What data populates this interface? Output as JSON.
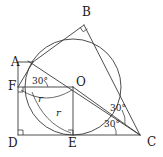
{
  "figure": {
    "kind": "geometry-diagram",
    "stroke_color": "#3a3a3a",
    "background_color": "#ffffff",
    "text_color": "#1a1a1a"
  },
  "vertices": [
    {
      "id": "A",
      "label": "A",
      "x": 33,
      "y": 62,
      "label_x": 11,
      "label_y": 56
    },
    {
      "id": "B",
      "label": "B",
      "x": 84,
      "y": 25,
      "label_x": 82,
      "label_y": 6
    },
    {
      "id": "C",
      "label": "C",
      "x": 140,
      "y": 135,
      "label_x": 147,
      "label_y": 136
    },
    {
      "id": "D",
      "label": "D",
      "x": 18,
      "y": 135,
      "label_x": 8,
      "label_y": 137
    },
    {
      "id": "E",
      "label": "E",
      "x": 73,
      "y": 135,
      "label_x": 68,
      "label_y": 137
    },
    {
      "id": "F",
      "label": "F",
      "x": 18,
      "y": 87,
      "label_x": 8,
      "label_y": 80
    },
    {
      "id": "O",
      "label": "O",
      "x": 73,
      "y": 87,
      "label_x": 76,
      "label_y": 76
    }
  ],
  "circle": {
    "center_x": 73,
    "center_y": 87,
    "radius": 48
  },
  "segment_labels": [
    {
      "id": "radius-horizontal",
      "text": "r",
      "x": 38,
      "y": 94
    },
    {
      "id": "radius-vertical",
      "text": "r",
      "x": 56,
      "y": 108
    }
  ],
  "angle_labels": [
    {
      "id": "angle-at-F",
      "text": "30°",
      "x": 32,
      "y": 77
    },
    {
      "id": "angle-upper-at-C",
      "text": "30°",
      "x": 110,
      "y": 104
    },
    {
      "id": "angle-lower-at-C",
      "text": "30°",
      "x": 104,
      "y": 120
    }
  ],
  "right_angle_marks": [
    {
      "id": "right-angle-at-B",
      "x": 84,
      "y": 25
    },
    {
      "id": "right-angle-at-F",
      "x": 18,
      "y": 87
    },
    {
      "id": "right-angle-at-E",
      "x": 73,
      "y": 135
    },
    {
      "id": "right-angle-at-D",
      "x": 18,
      "y": 135
    }
  ]
}
